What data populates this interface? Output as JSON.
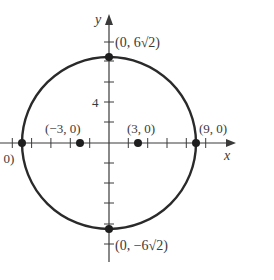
{
  "figure": {
    "type": "coordinate-graph",
    "axes": {
      "x_label": "x",
      "y_label": "y",
      "y_tick_label": "4"
    },
    "curve": {
      "shape": "ellipse",
      "center": [
        0,
        0
      ],
      "x_intercepts": [
        -9,
        9
      ],
      "y_intercepts": [
        "6√2",
        "-6√2"
      ]
    },
    "points": [
      {
        "id": "top-vertex",
        "label": "(0, 6√2)"
      },
      {
        "id": "bottom-vertex",
        "label": "(0, −6√2)"
      },
      {
        "id": "right-vertex",
        "label": "(9, 0)"
      },
      {
        "id": "left-vertex",
        "label": "(−9, 0)",
        "visible_label": ", 0)"
      },
      {
        "id": "left-focus",
        "label": "(−3, 0)"
      },
      {
        "id": "right-focus",
        "label": "(3, 0)"
      }
    ],
    "colors": {
      "curve": "#2a2a2a",
      "axis": "#3a3a3a",
      "text": "#3a3a3a"
    }
  }
}
